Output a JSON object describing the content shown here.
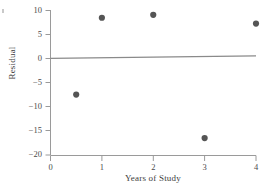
{
  "chart_data": {
    "type": "scatter",
    "title": "",
    "subtitle": "",
    "xlabel": "Years of Study",
    "ylabel": "Residual",
    "xlim": [
      0,
      4
    ],
    "ylim": [
      -20,
      10
    ],
    "xticks": [
      0,
      1,
      2,
      3,
      4
    ],
    "xticklabels": [
      "0",
      "1",
      "2",
      "3",
      "4"
    ],
    "yticks": [
      10,
      5,
      0,
      -5,
      -10,
      -15,
      -20
    ],
    "yticklabels": [
      "10",
      "5",
      "0",
      "−5",
      "−10",
      "−15",
      "−20"
    ],
    "grid": false,
    "legend": null,
    "series": [
      {
        "name": "Residuals",
        "marker": "filled-circle",
        "color": "#555555",
        "points": [
          {
            "x": 0.5,
            "y": -7.5
          },
          {
            "x": 1.0,
            "y": 8.4
          },
          {
            "x": 2.0,
            "y": 9.0
          },
          {
            "x": 3.0,
            "y": -16.5
          },
          {
            "x": 4.0,
            "y": 7.2
          }
        ]
      }
    ],
    "reference_line": {
      "name": "zero-residual-line",
      "color": "#8a8a8a",
      "y_at_xmin": 0.0,
      "y_at_xmax": 0.5
    },
    "axis_color": "#9a9a9a"
  },
  "labels": {
    "ylabel": "Residual",
    "xlabel": "Years of Study"
  }
}
